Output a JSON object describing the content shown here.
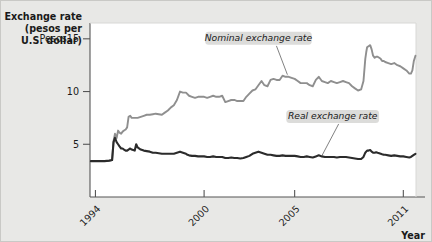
{
  "figure": {
    "background_color": "#e8e8e6",
    "plot_background_color": "#ffffff",
    "border_color": "#c9c9c6"
  },
  "chart_data": {
    "type": "line",
    "title": "",
    "ylabel_lines": [
      "Exchange rate",
      "(pesos per",
      "U.S. dollar)"
    ],
    "xlabel": "Year",
    "y_unit_prefix": "Pesos",
    "yticks": [
      5,
      10,
      15
    ],
    "ytick_labels": [
      "5",
      "10",
      "Pesos15"
    ],
    "ylim": [
      0,
      16.5
    ],
    "grid": false,
    "xticks": [
      1994,
      2000,
      2005,
      2011
    ],
    "xtick_labels": [
      "1994",
      "2000",
      "2005",
      "2011"
    ],
    "xlim": [
      1993.7,
      2011.7
    ],
    "legend_position": "inline-annotations",
    "series": [
      {
        "name": "Nominal exchange rate",
        "color": "#8f8f8f",
        "width": 1.9,
        "label_x": 2003.0,
        "label_y": 14.9,
        "leader_to_x": 2004.6,
        "leader_to_y": 11.6,
        "x": [
          1993.75,
          1994.0,
          1994.17,
          1994.33,
          1994.5,
          1994.67,
          1994.83,
          1994.92,
          1995.0,
          1995.08,
          1995.17,
          1995.25,
          1995.33,
          1995.42,
          1995.5,
          1995.58,
          1995.67,
          1995.75,
          1995.83,
          1995.92,
          1996.0,
          1996.17,
          1996.33,
          1996.5,
          1996.67,
          1996.83,
          1997.0,
          1997.17,
          1997.33,
          1997.5,
          1997.67,
          1997.83,
          1998.0,
          1998.17,
          1998.33,
          1998.5,
          1998.67,
          1998.83,
          1999.0,
          1999.17,
          1999.33,
          1999.5,
          1999.67,
          1999.83,
          2000.0,
          2000.17,
          2000.33,
          2000.5,
          2000.67,
          2000.83,
          2001.0,
          2001.17,
          2001.33,
          2001.5,
          2001.67,
          2001.83,
          2002.0,
          2002.17,
          2002.33,
          2002.5,
          2002.67,
          2002.83,
          2003.0,
          2003.17,
          2003.33,
          2003.5,
          2003.67,
          2003.83,
          2004.0,
          2004.17,
          2004.33,
          2004.5,
          2004.67,
          2004.83,
          2005.0,
          2005.17,
          2005.33,
          2005.5,
          2005.67,
          2005.83,
          2006.0,
          2006.17,
          2006.33,
          2006.5,
          2006.67,
          2006.83,
          2007.0,
          2007.17,
          2007.33,
          2007.5,
          2007.67,
          2007.83,
          2008.0,
          2008.17,
          2008.33,
          2008.5,
          2008.67,
          2008.8,
          2008.9,
          2008.95,
          2009.0,
          2009.08,
          2009.17,
          2009.25,
          2009.33,
          2009.42,
          2009.5,
          2009.58,
          2009.67,
          2009.75,
          2009.83,
          2009.92,
          2010.0,
          2010.17,
          2010.33,
          2010.5,
          2010.67,
          2010.83,
          2011.0,
          2011.17,
          2011.33,
          2011.42,
          2011.5,
          2011.58,
          2011.67
        ],
        "y": [
          3.4,
          3.4,
          3.4,
          3.4,
          3.4,
          3.4,
          3.45,
          3.5,
          5.3,
          6.0,
          5.6,
          6.3,
          6.1,
          6.0,
          6.2,
          6.3,
          6.4,
          6.6,
          7.6,
          7.7,
          7.5,
          7.5,
          7.5,
          7.6,
          7.7,
          7.8,
          7.8,
          7.85,
          7.9,
          7.85,
          7.8,
          8.0,
          8.2,
          8.5,
          8.7,
          9.2,
          10.0,
          9.9,
          9.9,
          9.6,
          9.5,
          9.4,
          9.5,
          9.5,
          9.5,
          9.4,
          9.5,
          9.6,
          9.5,
          9.5,
          9.6,
          9.0,
          9.1,
          9.2,
          9.2,
          9.1,
          9.1,
          9.1,
          9.5,
          9.8,
          10.1,
          10.2,
          10.6,
          11.0,
          10.6,
          10.5,
          11.1,
          11.2,
          11.1,
          11.1,
          11.5,
          11.4,
          11.4,
          11.3,
          11.2,
          11.0,
          10.8,
          10.8,
          10.8,
          10.6,
          10.5,
          11.1,
          11.4,
          11.0,
          10.9,
          10.8,
          11.0,
          10.9,
          10.8,
          10.9,
          11.0,
          10.9,
          10.8,
          10.5,
          10.3,
          10.1,
          10.2,
          11.0,
          13.1,
          13.7,
          14.2,
          14.3,
          14.4,
          14.0,
          13.4,
          13.2,
          13.3,
          13.3,
          13.2,
          13.1,
          12.9,
          12.9,
          12.8,
          12.7,
          12.6,
          12.7,
          12.5,
          12.4,
          12.2,
          12.0,
          11.7,
          11.7,
          12.0,
          12.9,
          13.4
        ]
      },
      {
        "name": "Real exchange rate",
        "color": "#2b2b2b",
        "width": 2.1,
        "label_x": 2007.1,
        "label_y": 7.5,
        "leader_to_x": 2006.5,
        "leader_to_y": 3.9,
        "x": [
          1993.75,
          1994.0,
          1994.25,
          1994.5,
          1994.75,
          1994.92,
          1995.0,
          1995.08,
          1995.17,
          1995.25,
          1995.33,
          1995.42,
          1995.5,
          1995.58,
          1995.67,
          1995.75,
          1995.83,
          1995.92,
          1996.0,
          1996.17,
          1996.25,
          1996.33,
          1996.5,
          1996.67,
          1996.83,
          1997.0,
          1997.17,
          1997.33,
          1997.5,
          1997.67,
          1997.83,
          1998.0,
          1998.17,
          1998.33,
          1998.5,
          1998.67,
          1998.83,
          1999.0,
          1999.08,
          1999.17,
          1999.33,
          1999.5,
          1999.67,
          1999.83,
          2000.0,
          2000.17,
          2000.33,
          2000.5,
          2000.67,
          2000.83,
          2001.0,
          2001.17,
          2001.33,
          2001.5,
          2001.67,
          2001.83,
          2002.0,
          2002.17,
          2002.33,
          2002.5,
          2002.67,
          2002.83,
          2003.0,
          2003.17,
          2003.33,
          2003.5,
          2003.67,
          2003.83,
          2004.0,
          2004.17,
          2004.33,
          2004.5,
          2004.67,
          2004.83,
          2005.0,
          2005.17,
          2005.33,
          2005.5,
          2005.67,
          2005.83,
          2006.0,
          2006.17,
          2006.33,
          2006.5,
          2006.67,
          2006.83,
          2007.0,
          2007.17,
          2007.33,
          2007.5,
          2007.67,
          2007.83,
          2008.0,
          2008.17,
          2008.33,
          2008.5,
          2008.67,
          2008.8,
          2008.9,
          2008.95,
          2009.0,
          2009.08,
          2009.17,
          2009.25,
          2009.33,
          2009.42,
          2009.5,
          2009.58,
          2009.67,
          2009.75,
          2009.83,
          2009.92,
          2010.0,
          2010.17,
          2010.33,
          2010.5,
          2010.67,
          2010.83,
          2011.0,
          2011.17,
          2011.33,
          2011.42,
          2011.5,
          2011.58,
          2011.67
        ],
        "y": [
          3.4,
          3.4,
          3.4,
          3.4,
          3.45,
          3.5,
          5.2,
          5.6,
          5.2,
          5.0,
          4.8,
          4.6,
          4.6,
          4.5,
          4.4,
          4.4,
          4.5,
          4.6,
          4.5,
          4.4,
          5.0,
          4.7,
          4.5,
          4.4,
          4.35,
          4.3,
          4.2,
          4.2,
          4.15,
          4.1,
          4.1,
          4.1,
          4.1,
          4.1,
          4.2,
          4.3,
          4.2,
          4.1,
          4.0,
          3.95,
          3.9,
          3.9,
          3.85,
          3.85,
          3.85,
          3.8,
          3.8,
          3.85,
          3.8,
          3.8,
          3.8,
          3.7,
          3.7,
          3.75,
          3.7,
          3.7,
          3.65,
          3.7,
          3.8,
          3.9,
          4.1,
          4.2,
          4.3,
          4.2,
          4.1,
          4.0,
          4.0,
          3.95,
          3.9,
          3.9,
          3.95,
          3.9,
          3.9,
          3.9,
          3.9,
          3.85,
          3.8,
          3.8,
          3.85,
          3.8,
          3.75,
          3.85,
          3.95,
          3.85,
          3.8,
          3.8,
          3.8,
          3.8,
          3.75,
          3.8,
          3.8,
          3.8,
          3.75,
          3.7,
          3.65,
          3.6,
          3.6,
          3.8,
          4.2,
          4.3,
          4.4,
          4.4,
          4.45,
          4.3,
          4.2,
          4.2,
          4.25,
          4.2,
          4.15,
          4.1,
          4.05,
          4.0,
          4.0,
          3.95,
          3.9,
          3.95,
          3.9,
          3.85,
          3.85,
          3.8,
          3.75,
          3.8,
          3.9,
          4.0,
          4.1
        ]
      }
    ]
  }
}
